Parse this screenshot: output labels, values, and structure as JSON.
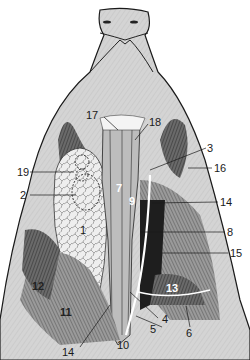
{
  "figure": {
    "type": "anatomical-illustration",
    "view": "ventral view of head and neck",
    "colors": {
      "background": "#ffffff",
      "skin": "#d9d9d9",
      "outline": "#1a1a1a",
      "muscle_dark": "#3a3a3a",
      "muscle_mid": "#8a8a8a",
      "gland": "#e6e6e6",
      "vessel": "#ffffff"
    },
    "labels": [
      {
        "id": "17",
        "text": "17"
      },
      {
        "id": "18",
        "text": "18"
      },
      {
        "id": "3",
        "text": "3"
      },
      {
        "id": "16",
        "text": "16"
      },
      {
        "id": "19",
        "text": "19"
      },
      {
        "id": "2",
        "text": "2"
      },
      {
        "id": "7",
        "text": "7"
      },
      {
        "id": "9",
        "text": "9"
      },
      {
        "id": "14a",
        "text": "14"
      },
      {
        "id": "1",
        "text": "1"
      },
      {
        "id": "8",
        "text": "8"
      },
      {
        "id": "15",
        "text": "15"
      },
      {
        "id": "12",
        "text": "12"
      },
      {
        "id": "13",
        "text": "13"
      },
      {
        "id": "11",
        "text": "11"
      },
      {
        "id": "4",
        "text": "4"
      },
      {
        "id": "5",
        "text": "5"
      },
      {
        "id": "6",
        "text": "6"
      },
      {
        "id": "14b",
        "text": "14"
      },
      {
        "id": "10",
        "text": "10"
      }
    ]
  }
}
